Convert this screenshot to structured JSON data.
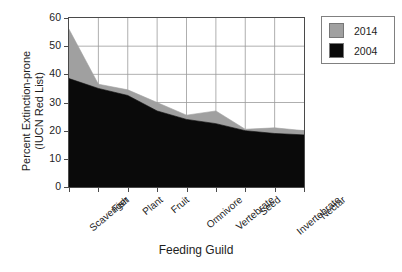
{
  "chart_data": {
    "type": "area",
    "title": "",
    "xlabel": "Feeding Guild",
    "ylabel_line1": "Percent Extinction-prone",
    "ylabel_line2": "(IUCN Red List)",
    "categories": [
      "Scavenger",
      "Fish",
      "Plant",
      "Fruit",
      "Omnivore",
      "Vertebrate",
      "Seed",
      "Invertebrate",
      "Nectar"
    ],
    "series": [
      {
        "name": "2014",
        "color": "#a0a0a0",
        "values": [
          56,
          36.5,
          34.5,
          30,
          25.5,
          27,
          20.5,
          21,
          20
        ]
      },
      {
        "name": "2004",
        "color": "#0a0a0a",
        "values": [
          38.5,
          35,
          32.5,
          27,
          24,
          22.5,
          20,
          19,
          18.5
        ]
      }
    ],
    "ylim": [
      0,
      60
    ],
    "yticks": [
      0,
      10,
      20,
      30,
      40,
      50,
      60
    ],
    "grid": true,
    "stacked_overlay": true,
    "legend_position": "right-outside"
  },
  "legend": {
    "items": [
      {
        "label": "2014",
        "color": "#a0a0a0"
      },
      {
        "label": "2004",
        "color": "#0a0a0a"
      }
    ]
  }
}
